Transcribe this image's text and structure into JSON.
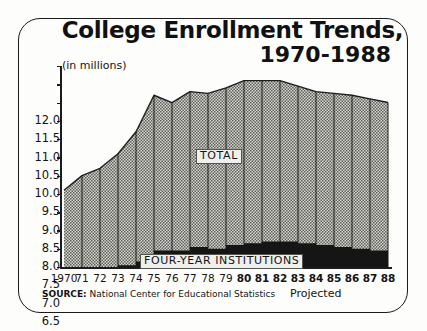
{
  "figure": {
    "title_line1": "College Enrollment Trends,",
    "title_line2": "1970-1988",
    "units_label": "(in millions)",
    "source_prefix": "SOURCE:",
    "source_text": "National Center for Educational Statistics",
    "projected_note": "Projected",
    "total_tag": "TOTAL",
    "fouryear_tag": "FOUR-YEAR INSTITUTIONS",
    "colors": {
      "ink": "#1a1a1a",
      "total_fill": "#b9b9b4",
      "fouryear_fill": "#151515",
      "paper": "#fdfdfb",
      "label_box": "#efefee"
    }
  },
  "chart_data": {
    "type": "area",
    "title": "College Enrollment Trends, 1970-1988",
    "subtitle": "(in millions)",
    "xlabel": "",
    "ylabel": "(in millions)",
    "ylim": [
      6.5,
      12.0
    ],
    "yticks": [
      12.0,
      11.5,
      11.0,
      10.5,
      10.0,
      9.5,
      9.0,
      8.5,
      8.0,
      7.5,
      7.0,
      6.5
    ],
    "ytick_labels": [
      "12.0",
      "11.5",
      "11.0",
      "10.5",
      "10.0",
      "9.5",
      "9.0",
      "8.5",
      "8.0",
      "7.5",
      "7.0",
      "6.5"
    ],
    "grid": "vertical-year-lines",
    "legend": "inline-labels",
    "x": [
      1970,
      1971,
      1972,
      1973,
      1974,
      1975,
      1976,
      1977,
      1978,
      1979,
      1980,
      1981,
      1982,
      1983,
      1984,
      1985,
      1986,
      1987,
      1988
    ],
    "xtick_labels": [
      "1970",
      "71",
      "72",
      "73",
      "74",
      "75",
      "76",
      "77",
      "78",
      "79",
      "80",
      "81",
      "82",
      "83",
      "84",
      "85",
      "86",
      "87",
      "88"
    ],
    "projected_from": 1980,
    "series": [
      {
        "name": "TOTAL",
        "style": "stippled-gray-area",
        "values": [
          8.6,
          9.0,
          9.2,
          9.6,
          10.2,
          11.2,
          11.0,
          11.3,
          11.25,
          11.4,
          11.6,
          11.6,
          11.6,
          11.45,
          11.3,
          11.25,
          11.2,
          11.1,
          11.0
        ]
      },
      {
        "name": "FOUR-YEAR INSTITUTIONS",
        "style": "solid-black-area",
        "values": [
          6.5,
          6.5,
          6.5,
          6.55,
          6.65,
          6.95,
          6.95,
          7.05,
          7.0,
          7.1,
          7.15,
          7.2,
          7.2,
          7.15,
          7.1,
          7.05,
          7.0,
          6.95,
          6.9
        ]
      }
    ],
    "annotations": [
      {
        "text": "TOTAL",
        "x": 1979,
        "y": 9.6
      },
      {
        "text": "FOUR-YEAR INSTITUTIONS",
        "x": 1977,
        "y": 6.85
      },
      {
        "text": "Projected",
        "x": 1984,
        "y": 6.2
      }
    ]
  }
}
